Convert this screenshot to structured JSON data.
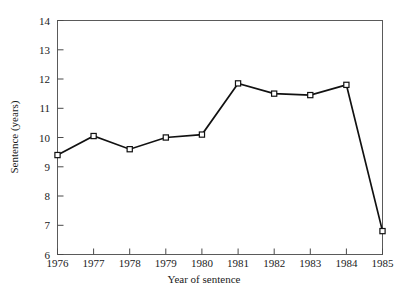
{
  "chart_data": {
    "type": "line",
    "title": "",
    "xlabel": "Year of sentence",
    "ylabel": "Sentence (years)",
    "x": [
      1976,
      1977,
      1978,
      1979,
      1980,
      1981,
      1982,
      1983,
      1984,
      1985
    ],
    "xtick_labels": [
      "1976",
      "1977",
      "1978",
      "1979",
      "1980",
      "1981",
      "1982",
      "1983",
      "1984",
      "1985"
    ],
    "values": [
      9.4,
      10.05,
      9.6,
      10.0,
      10.1,
      11.85,
      11.5,
      11.45,
      11.8,
      6.8
    ],
    "ytick_labels": [
      "6",
      "7",
      "8",
      "9",
      "10",
      "11",
      "12",
      "13",
      "14"
    ],
    "yticks": [
      6,
      7,
      8,
      9,
      10,
      11,
      12,
      13,
      14
    ],
    "ylim": [
      6,
      14
    ],
    "xlim": [
      1976,
      1985
    ],
    "grid": false,
    "legend": null,
    "marker": "open-square",
    "line_color": "#111111",
    "marker_fill": "#ffffff",
    "frame_color": "#5a5a5a"
  }
}
